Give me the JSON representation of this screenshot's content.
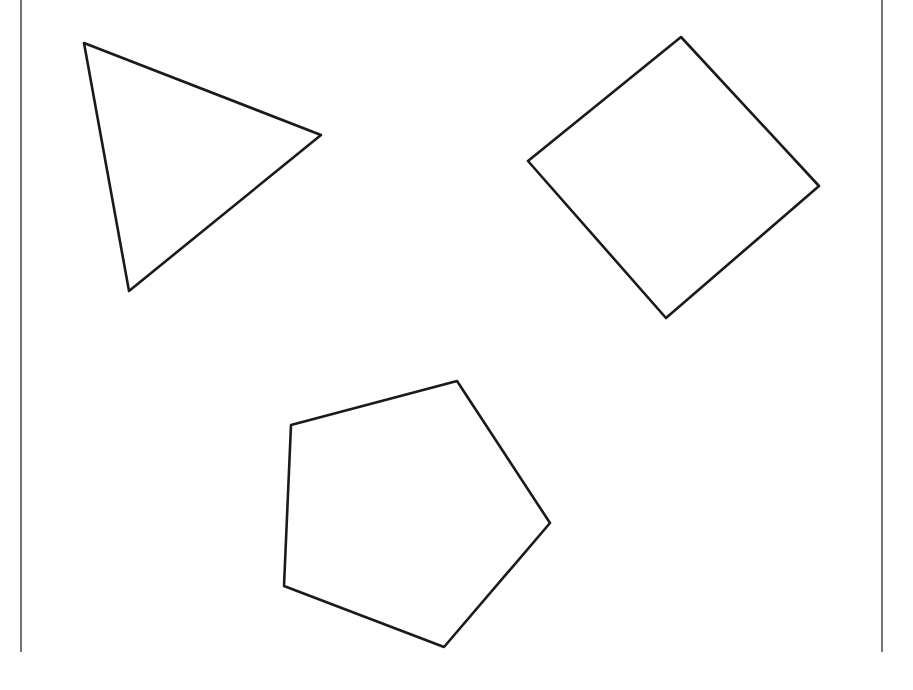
{
  "diagram": {
    "type": "geometric-shapes",
    "background": "#ffffff",
    "stroke_color": "#1a1a1a",
    "frame": {
      "left_line": {
        "x": 21,
        "y1": 0,
        "y2": 652
      },
      "right_line": {
        "x": 882,
        "y1": 0,
        "y2": 652
      }
    },
    "shapes": [
      {
        "name": "triangle",
        "sides": 3,
        "points": [
          [
            84,
            43
          ],
          [
            321,
            135
          ],
          [
            129,
            291
          ]
        ]
      },
      {
        "name": "square",
        "sides": 4,
        "points": [
          [
            681,
            37
          ],
          [
            819,
            186
          ],
          [
            666,
            318
          ],
          [
            528,
            161
          ]
        ]
      },
      {
        "name": "pentagon",
        "sides": 5,
        "points": [
          [
            457,
            381
          ],
          [
            550,
            523
          ],
          [
            444,
            647
          ],
          [
            284,
            586
          ],
          [
            291,
            425
          ]
        ]
      }
    ]
  }
}
